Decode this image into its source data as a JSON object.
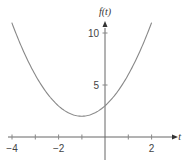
{
  "chart_data": {
    "type": "line",
    "title": "",
    "xlabel": "t",
    "ylabel": "f(t)",
    "xlim": [
      -4,
      3
    ],
    "ylim": [
      0,
      11
    ],
    "grid": false,
    "legend": null,
    "x_ticks": [
      -4,
      -3,
      -2,
      -1,
      0,
      1,
      2
    ],
    "x_tick_labels": [
      "-4",
      "",
      "-2",
      "",
      "",
      "",
      "2"
    ],
    "y_ticks": [
      5,
      10
    ],
    "y_tick_labels": [
      "5",
      "10"
    ],
    "series": [
      {
        "name": "f(t) = t^2 + 2t + 3",
        "x": [
          -4,
          -3.5,
          -3,
          -2.5,
          -2,
          -1.5,
          -1,
          -0.5,
          0,
          0.5,
          1,
          1.5,
          2
        ],
        "y": [
          11,
          8.25,
          6,
          4.25,
          3,
          2.25,
          2,
          2.25,
          3,
          4.25,
          6,
          8.25,
          11
        ]
      }
    ],
    "annotations": []
  },
  "labels": {
    "x_axis": "t",
    "y_axis": "f(t)",
    "x_tick_neg4": "−4",
    "x_tick_neg2": "−2",
    "x_tick_2": "2",
    "y_tick_5": "5",
    "y_tick_10": "10"
  },
  "colors": {
    "curve": "#888888",
    "axis": "#666666"
  }
}
